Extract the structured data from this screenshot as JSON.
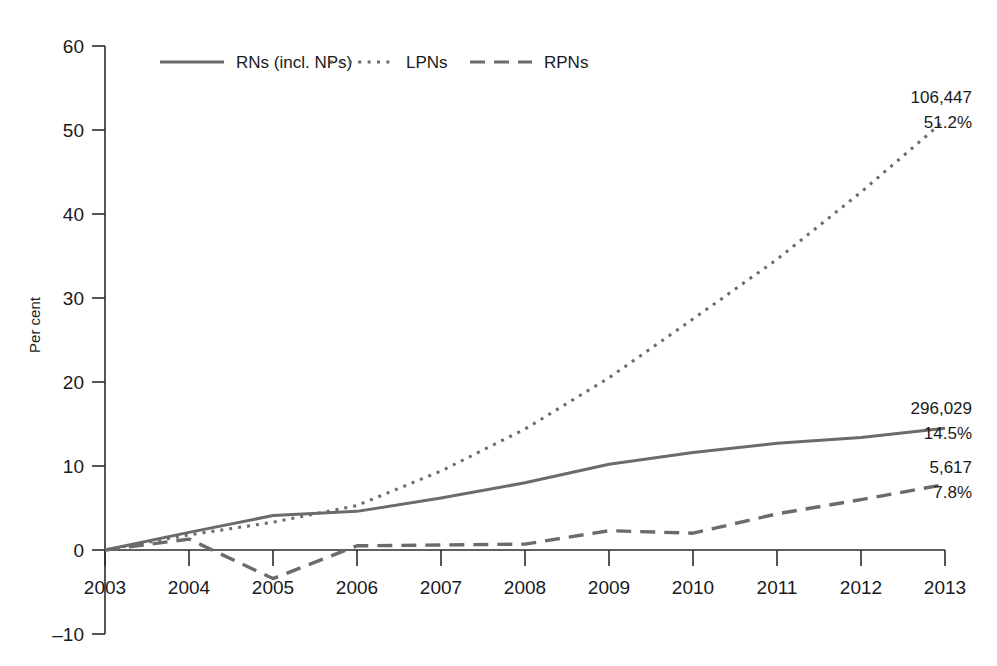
{
  "chart_data": {
    "type": "line",
    "title": "",
    "xlabel": "",
    "ylabel": "Per cent",
    "ylim": [
      -10,
      60
    ],
    "yticks": [
      -10,
      0,
      10,
      20,
      30,
      40,
      50,
      60
    ],
    "grid": false,
    "legend_position": "top-center",
    "x": [
      2003,
      2004,
      2005,
      2006,
      2007,
      2008,
      2009,
      2010,
      2011,
      2012,
      2013
    ],
    "categories": [
      "2003",
      "2004",
      "2005",
      "2006",
      "2007",
      "2008",
      "2009",
      "2010",
      "2011",
      "2012",
      "2013"
    ],
    "series": [
      {
        "name": "RNs (incl. NPs)",
        "style": "solid",
        "color": "#6b6b6b",
        "values": [
          0.0,
          2.1,
          4.1,
          4.6,
          6.2,
          8.0,
          10.2,
          11.6,
          12.7,
          13.4,
          14.5
        ],
        "end_label_value": "296,029",
        "end_label_percent": "14.5%"
      },
      {
        "name": "LPNs",
        "style": "dotted",
        "color": "#6b6b6b",
        "values": [
          0.0,
          1.8,
          3.3,
          5.3,
          9.4,
          14.4,
          20.5,
          27.5,
          34.6,
          42.6,
          51.2
        ],
        "end_label_value": "106,447",
        "end_label_percent": "51.2%"
      },
      {
        "name": "RPNs",
        "style": "dashed",
        "color": "#6b6b6b",
        "values": [
          0.0,
          1.3,
          -3.4,
          0.5,
          0.6,
          0.7,
          2.3,
          2.0,
          4.3,
          6.0,
          7.8
        ],
        "end_label_value": "5,617",
        "end_label_percent": "7.8%"
      }
    ]
  },
  "axis": {
    "y_title": "Per cent",
    "y_tick_labels": [
      "60",
      "50",
      "40",
      "30",
      "20",
      "10",
      "0",
      "-10"
    ],
    "x_tick_labels": [
      "2003",
      "2004",
      "2005",
      "2006",
      "2007",
      "2008",
      "2009",
      "2010",
      "2011",
      "2012",
      "2013"
    ]
  },
  "legend": {
    "items": [
      {
        "label": "RNs (incl. NPs)",
        "style": "solid"
      },
      {
        "label": "LPNs",
        "style": "dotted"
      },
      {
        "label": "RPNs",
        "style": "dashed"
      }
    ]
  },
  "end_labels": {
    "lpns": {
      "value": "106,447",
      "percent": "51.2%"
    },
    "rns": {
      "value": "296,029",
      "percent": "14.5%"
    },
    "rpns": {
      "value": "5,617",
      "percent": "7.8%"
    }
  },
  "colors": {
    "line": "#6b6b6b",
    "axis": "#2b2b2b",
    "text": "#1a1a1a",
    "background": "#ffffff"
  }
}
